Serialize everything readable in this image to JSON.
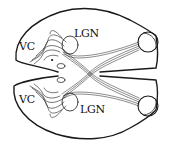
{
  "diagram": {
    "labels": {
      "vc_top": "VC",
      "vc_bottom": "VC",
      "lgn_top": "LGN",
      "lgn_bottom": "LGN"
    },
    "colors": {
      "stroke": "#1a1a1a",
      "background": "#ffffff"
    }
  }
}
